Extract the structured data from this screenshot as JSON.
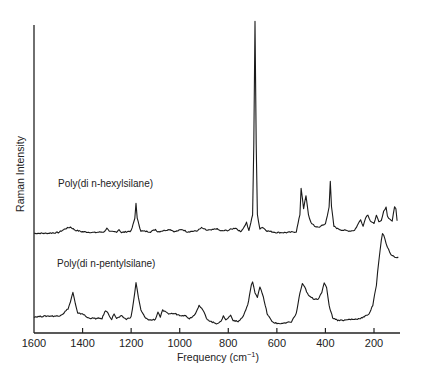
{
  "chart_data": {
    "type": "line",
    "title": "",
    "xlabel": "Frequency (cm⁻¹)",
    "ylabel": "Raman Intensity",
    "xlim": [
      1600,
      100
    ],
    "x_reversed": true,
    "xticks": [
      1600,
      1400,
      1200,
      1000,
      800,
      600,
      400,
      200
    ],
    "yticks": [],
    "grid": false,
    "legend": "inline labels above each trace",
    "series": [
      {
        "name": "Poly(di n-hexylsilane)",
        "offset": "upper trace",
        "points": [
          [
            1600,
            6
          ],
          [
            1550,
            6
          ],
          [
            1500,
            7
          ],
          [
            1470,
            12
          ],
          [
            1450,
            14
          ],
          [
            1430,
            10
          ],
          [
            1400,
            8
          ],
          [
            1350,
            7
          ],
          [
            1310,
            8
          ],
          [
            1300,
            13
          ],
          [
            1290,
            8
          ],
          [
            1260,
            8
          ],
          [
            1250,
            11
          ],
          [
            1240,
            7
          ],
          [
            1200,
            9
          ],
          [
            1185,
            25
          ],
          [
            1180,
            45
          ],
          [
            1175,
            25
          ],
          [
            1160,
            9
          ],
          [
            1120,
            8
          ],
          [
            1100,
            11
          ],
          [
            1090,
            8
          ],
          [
            1060,
            10
          ],
          [
            1040,
            11
          ],
          [
            1020,
            8
          ],
          [
            990,
            11
          ],
          [
            970,
            8
          ],
          [
            930,
            9
          ],
          [
            910,
            13
          ],
          [
            890,
            10
          ],
          [
            870,
            10
          ],
          [
            850,
            12
          ],
          [
            830,
            9
          ],
          [
            800,
            10
          ],
          [
            770,
            13
          ],
          [
            750,
            8
          ],
          [
            735,
            14
          ],
          [
            725,
            20
          ],
          [
            715,
            9
          ],
          [
            700,
            30
          ],
          [
            695,
            120
          ],
          [
            690,
            278
          ],
          [
            685,
            120
          ],
          [
            680,
            30
          ],
          [
            670,
            12
          ],
          [
            660,
            14
          ],
          [
            640,
            9
          ],
          [
            600,
            7
          ],
          [
            560,
            7
          ],
          [
            520,
            8
          ],
          [
            505,
            30
          ],
          [
            500,
            64
          ],
          [
            490,
            38
          ],
          [
            480,
            54
          ],
          [
            470,
            30
          ],
          [
            460,
            20
          ],
          [
            445,
            15
          ],
          [
            430,
            14
          ],
          [
            420,
            15
          ],
          [
            400,
            18
          ],
          [
            385,
            40
          ],
          [
            380,
            72
          ],
          [
            375,
            40
          ],
          [
            365,
            15
          ],
          [
            350,
            12
          ],
          [
            330,
            10
          ],
          [
            300,
            9
          ],
          [
            280,
            10
          ],
          [
            265,
            18
          ],
          [
            255,
            24
          ],
          [
            245,
            15
          ],
          [
            235,
            26
          ],
          [
            225,
            30
          ],
          [
            215,
            22
          ],
          [
            200,
            18
          ],
          [
            190,
            30
          ],
          [
            180,
            20
          ],
          [
            170,
            22
          ],
          [
            160,
            34
          ],
          [
            150,
            40
          ],
          [
            145,
            28
          ],
          [
            135,
            24
          ],
          [
            125,
            22
          ],
          [
            115,
            40
          ],
          [
            110,
            38
          ],
          [
            105,
            22
          ]
        ]
      },
      {
        "name": "Poly(di n-pentylsilane)",
        "offset": "lower trace",
        "points": [
          [
            1600,
            16
          ],
          [
            1550,
            17
          ],
          [
            1500,
            17
          ],
          [
            1480,
            20
          ],
          [
            1460,
            26
          ],
          [
            1450,
            34
          ],
          [
            1440,
            46
          ],
          [
            1430,
            32
          ],
          [
            1420,
            20
          ],
          [
            1400,
            20
          ],
          [
            1380,
            15
          ],
          [
            1350,
            14
          ],
          [
            1320,
            14
          ],
          [
            1305,
            24
          ],
          [
            1295,
            20
          ],
          [
            1280,
            13
          ],
          [
            1270,
            20
          ],
          [
            1260,
            14
          ],
          [
            1240,
            17
          ],
          [
            1220,
            13
          ],
          [
            1200,
            16
          ],
          [
            1190,
            35
          ],
          [
            1180,
            58
          ],
          [
            1170,
            40
          ],
          [
            1160,
            24
          ],
          [
            1140,
            14
          ],
          [
            1120,
            12
          ],
          [
            1100,
            13
          ],
          [
            1090,
            22
          ],
          [
            1080,
            16
          ],
          [
            1070,
            24
          ],
          [
            1050,
            20
          ],
          [
            1020,
            20
          ],
          [
            1000,
            18
          ],
          [
            980,
            18
          ],
          [
            960,
            14
          ],
          [
            940,
            18
          ],
          [
            920,
            30
          ],
          [
            910,
            26
          ],
          [
            900,
            22
          ],
          [
            890,
            14
          ],
          [
            870,
            10
          ],
          [
            850,
            8
          ],
          [
            830,
            10
          ],
          [
            820,
            18
          ],
          [
            810,
            12
          ],
          [
            790,
            18
          ],
          [
            780,
            12
          ],
          [
            760,
            10
          ],
          [
            740,
            16
          ],
          [
            720,
            30
          ],
          [
            705,
            55
          ],
          [
            700,
            58
          ],
          [
            690,
            46
          ],
          [
            680,
            40
          ],
          [
            670,
            53
          ],
          [
            660,
            45
          ],
          [
            640,
            20
          ],
          [
            620,
            10
          ],
          [
            600,
            8
          ],
          [
            570,
            8
          ],
          [
            540,
            10
          ],
          [
            520,
            20
          ],
          [
            505,
            45
          ],
          [
            495,
            56
          ],
          [
            485,
            52
          ],
          [
            470,
            42
          ],
          [
            450,
            38
          ],
          [
            430,
            38
          ],
          [
            415,
            45
          ],
          [
            405,
            58
          ],
          [
            395,
            52
          ],
          [
            385,
            30
          ],
          [
            370,
            15
          ],
          [
            350,
            12
          ],
          [
            320,
            12
          ],
          [
            300,
            13
          ],
          [
            280,
            13
          ],
          [
            260,
            14
          ],
          [
            240,
            16
          ],
          [
            220,
            20
          ],
          [
            205,
            30
          ],
          [
            190,
            55
          ],
          [
            180,
            85
          ],
          [
            170,
            110
          ],
          [
            165,
            118
          ],
          [
            160,
            116
          ],
          [
            150,
            105
          ],
          [
            140,
            98
          ],
          [
            130,
            92
          ],
          [
            120,
            90
          ],
          [
            110,
            88
          ],
          [
            100,
            89
          ]
        ]
      }
    ]
  },
  "axes": {
    "x_title": "Frequency (cm",
    "x_title_sup": "−1",
    "x_title_close": ")",
    "y_title": "Raman Intensity",
    "tick_labels": [
      "1600",
      "1400",
      "1200",
      "1000",
      "800",
      "600",
      "400",
      "200"
    ]
  },
  "labels": {
    "upper": "Poly(di n-hexylsilane)",
    "lower": "Poly(di n-pentylsilane)"
  }
}
